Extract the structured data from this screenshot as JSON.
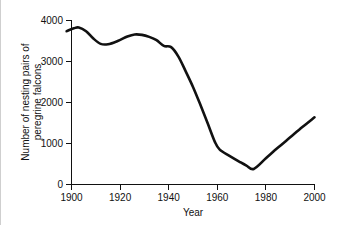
{
  "chart_data": {
    "type": "line",
    "title": "",
    "subtitle": "",
    "xlabel": "Year",
    "ylabel": "Number of nesting pairs of peregrine falcons",
    "ylabel_line1": "Number of nesting pairs of",
    "ylabel_line2": "peregrine falcons",
    "xlim": [
      1898,
      2000
    ],
    "ylim": [
      0,
      4000
    ],
    "xticks": [
      1900,
      1920,
      1940,
      1960,
      1980,
      2000
    ],
    "xtick_labels": [
      "1900",
      "1920",
      "1940",
      "1960",
      "1980",
      "2000"
    ],
    "yticks": [
      0,
      1000,
      2000,
      3000,
      4000
    ],
    "ytick_labels": [
      "0",
      "1000",
      "2000",
      "3000",
      "4000"
    ],
    "grid": false,
    "legend": "none",
    "line_color": "#111111",
    "background_color": "#ffffff",
    "series": [
      {
        "name": "Nesting pairs of peregrine falcons",
        "x": [
          1898,
          1901,
          1903,
          1906,
          1909,
          1912,
          1915,
          1919,
          1923,
          1926,
          1929,
          1932,
          1935,
          1938,
          1941,
          1944,
          1947,
          1950,
          1953,
          1956,
          1959,
          1961,
          1965,
          1969,
          1972,
          1975,
          1980,
          1985,
          1990,
          1995,
          2000
        ],
        "values": [
          3740,
          3810,
          3830,
          3740,
          3560,
          3430,
          3420,
          3500,
          3610,
          3660,
          3650,
          3600,
          3520,
          3380,
          3350,
          3120,
          2760,
          2380,
          1950,
          1500,
          1040,
          850,
          700,
          560,
          460,
          380,
          640,
          900,
          1150,
          1400,
          1640
        ]
      }
    ],
    "annotations": []
  }
}
